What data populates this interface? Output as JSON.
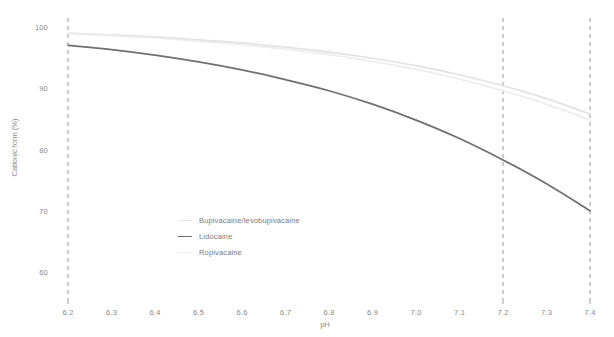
{
  "chart_data": {
    "type": "line",
    "title": "",
    "xlabel": "pH",
    "ylabel": "Cationic form (%)",
    "xlim": [
      6.2,
      7.4
    ],
    "ylim": [
      56,
      101
    ],
    "grid": false,
    "legend_position": "center-left-inside",
    "x_ticks": [
      "6.2",
      "6.3",
      "6.4",
      "6.5",
      "6.6",
      "6.7",
      "6.8",
      "6.9",
      "7.0",
      "7.1",
      "7.2",
      "7.3",
      "7.4"
    ],
    "x_tick_values": [
      6.2,
      6.3,
      6.4,
      6.5,
      6.6,
      6.7,
      6.8,
      6.9,
      7.0,
      7.1,
      7.2,
      7.3,
      7.4
    ],
    "y_ticks": [
      "100",
      "90",
      "80",
      "70",
      "60"
    ],
    "y_tick_values": [
      100,
      90,
      80,
      70,
      60
    ],
    "reference_lines": [
      {
        "name": "ph-6-2-reference-line",
        "x": 6.2,
        "style": "dashed",
        "color": "#9a9a9a"
      },
      {
        "name": "ph-7-2-reference-line",
        "x": 7.2,
        "style": "dashed",
        "color": "#9a9a9a"
      },
      {
        "name": "ph-7-4-reference-line",
        "x": 7.4,
        "style": "dashed",
        "color": "#9a9a9a"
      }
    ],
    "x": [
      6.2,
      6.3,
      6.4,
      6.5,
      6.6,
      6.7,
      6.8,
      6.9,
      7.0,
      7.1,
      7.2,
      7.3,
      7.4
    ],
    "series": [
      {
        "name": "Bupivacaine/levobupivacaine",
        "color": "#e2e2e2",
        "values": [
          99.0,
          98.7,
          98.4,
          97.9,
          97.4,
          96.7,
          95.9,
          94.9,
          93.7,
          92.2,
          90.4,
          88.3,
          85.8
        ]
      },
      {
        "name": "Lidocaine",
        "color": "#6f6f6f",
        "values": [
          97.0,
          96.3,
          95.4,
          94.3,
          93.0,
          91.4,
          89.6,
          87.4,
          84.8,
          81.8,
          78.3,
          74.4,
          70.0
        ]
      },
      {
        "name": "Ropivacaine",
        "color": "#ededed",
        "values": [
          98.9,
          98.6,
          98.2,
          97.7,
          97.1,
          96.4,
          95.5,
          94.4,
          93.1,
          91.5,
          89.6,
          87.4,
          84.8
        ]
      }
    ]
  },
  "legend": {
    "items": [
      {
        "label": "Bupivacaine/levobupivacaine",
        "color": "#e4e4e4"
      },
      {
        "label": "Lidocaine",
        "color": "#6f6f6f"
      },
      {
        "label": "Ropivacaine",
        "color": "#ededed"
      }
    ]
  },
  "axes": {
    "y_title": "Cationic form (%)",
    "x_title": "pH"
  }
}
